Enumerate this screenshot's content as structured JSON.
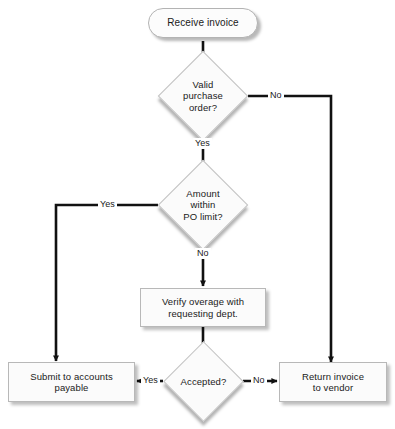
{
  "diagram": {
    "type": "flowchart",
    "background_color": "#ffffff",
    "line_color": "#111111",
    "shape_fill": "#fbfbfb",
    "shape_border": "#b8b8b8",
    "nodes": [
      {
        "id": "receive",
        "shape": "terminator",
        "label": "Receive invoice"
      },
      {
        "id": "valid_po",
        "shape": "decision",
        "label": "Valid\npurchase\norder?"
      },
      {
        "id": "within_limit",
        "shape": "decision",
        "label": "Amount\nwithin\nPO limit?"
      },
      {
        "id": "verify",
        "shape": "process",
        "label": "Verify overage with\nrequesting dept."
      },
      {
        "id": "accepted",
        "shape": "decision",
        "label": "Accepted?"
      },
      {
        "id": "submit",
        "shape": "process",
        "label": "Submit to accounts\npayable"
      },
      {
        "id": "return",
        "shape": "process",
        "label": "Return invoice\nto vendor"
      }
    ],
    "edges": [
      {
        "from": "receive",
        "to": "valid_po",
        "label": ""
      },
      {
        "from": "valid_po",
        "to": "return",
        "label": "No"
      },
      {
        "from": "valid_po",
        "to": "within_limit",
        "label": "Yes"
      },
      {
        "from": "within_limit",
        "to": "submit",
        "label": "Yes"
      },
      {
        "from": "within_limit",
        "to": "verify",
        "label": "No"
      },
      {
        "from": "verify",
        "to": "accepted",
        "label": ""
      },
      {
        "from": "accepted",
        "to": "submit",
        "label": "Yes"
      },
      {
        "from": "accepted",
        "to": "return",
        "label": "No"
      }
    ]
  },
  "edge_labels": {
    "valid_no": "No",
    "valid_yes": "Yes",
    "limit_yes": "Yes",
    "limit_no": "No",
    "accepted_yes": "Yes",
    "accepted_no": "No"
  },
  "caption": {
    "text": ""
  }
}
